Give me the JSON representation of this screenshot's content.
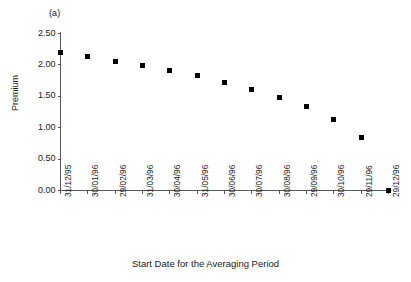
{
  "panel_label": "(a)",
  "chart_data": {
    "type": "scatter",
    "title": "(a)",
    "xlabel": "Start Date for the Averaging Period",
    "ylabel": "Premium",
    "categories": [
      "31/12/95",
      "30/01/96",
      "29/02/96",
      "31/03/96",
      "30/04/96",
      "31/05/96",
      "30/06/96",
      "30/07/96",
      "30/08/96",
      "29/09/96",
      "30/10/96",
      "29/11/96",
      "29/12/96"
    ],
    "values": [
      2.19,
      2.13,
      2.06,
      1.99,
      1.91,
      1.83,
      1.72,
      1.61,
      1.48,
      1.33,
      1.13,
      0.85,
      0.0
    ],
    "ylim": [
      0.0,
      2.5
    ],
    "ytick_labels": [
      "0.00",
      "0.50",
      "1.00",
      "1.50",
      "2.00",
      "2.50"
    ],
    "ytick_values": [
      0.0,
      0.5,
      1.0,
      1.5,
      2.0,
      2.5
    ],
    "grid": false,
    "legend": null,
    "marker": "filled-square",
    "marker_color": "#000000",
    "axis_color": "#595959"
  }
}
